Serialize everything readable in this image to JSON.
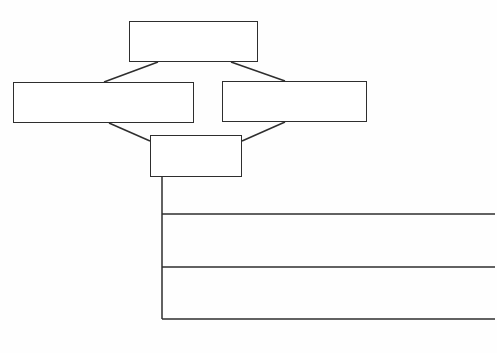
{
  "diagram": {
    "type": "hierarchy-template",
    "colors": {
      "background": "#ffffff",
      "stroke": "#2e2e2e"
    },
    "boxes": [
      {
        "id": "top",
        "label": "",
        "x": 129,
        "y": 21,
        "w": 129,
        "h": 41
      },
      {
        "id": "left",
        "label": "",
        "x": 13,
        "y": 82,
        "w": 181,
        "h": 41
      },
      {
        "id": "right",
        "label": "",
        "x": 222,
        "y": 81,
        "w": 145,
        "h": 41
      },
      {
        "id": "bottom",
        "label": "",
        "x": 150,
        "y": 135,
        "w": 92,
        "h": 42
      }
    ],
    "connectors": [
      {
        "from": "top",
        "to": "left",
        "x1": 158,
        "y1": 62,
        "x2": 104,
        "y2": 82
      },
      {
        "from": "top",
        "to": "right",
        "x1": 231,
        "y1": 62,
        "x2": 285,
        "y2": 81
      },
      {
        "from": "left",
        "to": "bottom",
        "x1": 109,
        "y1": 123,
        "x2": 150,
        "y2": 141
      },
      {
        "from": "right",
        "to": "bottom",
        "x1": 285,
        "y1": 122,
        "x2": 242,
        "y2": 141
      }
    ],
    "stem": {
      "x": 162,
      "y1": 177,
      "y2": 319
    },
    "branch_lines": [
      {
        "label": "",
        "y": 214,
        "x1": 162,
        "x2": 495
      },
      {
        "label": "",
        "y": 267,
        "x1": 162,
        "x2": 495
      },
      {
        "label": "",
        "y": 319,
        "x1": 162,
        "x2": 495
      }
    ]
  }
}
